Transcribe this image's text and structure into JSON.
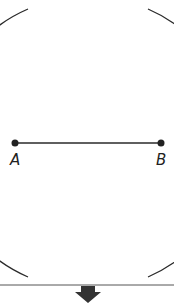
{
  "diagram": {
    "points": [
      {
        "label": "A",
        "x": 15,
        "y": 143
      },
      {
        "label": "B",
        "x": 161,
        "y": 143
      }
    ],
    "segment": {
      "from": "A",
      "to": "B"
    },
    "arcs": [
      {
        "center": "B",
        "radius": 146
      },
      {
        "center": "A",
        "radius": 146
      }
    ],
    "intersections": [
      {
        "x": 88,
        "y": 17
      },
      {
        "x": 88,
        "y": 269
      }
    ],
    "next_step_arrow": "down-arrow-icon",
    "colors": {
      "stroke": "#2a2a2a",
      "arrow": "#333333",
      "divider": "#555555"
    }
  }
}
